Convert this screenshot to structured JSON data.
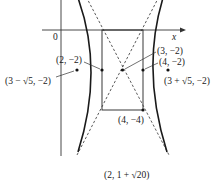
{
  "figure": {
    "type": "hyperbola",
    "center": "(3, −2)",
    "axes": {
      "x_label": "x",
      "origin_label": "0"
    },
    "points": [
      {
        "id": "vertex-left",
        "label": "(2, −2)"
      },
      {
        "id": "center",
        "label": "(3, −2)"
      },
      {
        "id": "vertex-right",
        "label": "(4, −2)"
      },
      {
        "id": "focus-left",
        "label": "(3 − √5, −2)"
      },
      {
        "id": "focus-right",
        "label": "(3 + √5, −2)"
      },
      {
        "id": "box-corner",
        "label": "(4, −4)"
      }
    ],
    "caption": "(2, 1 + √20)",
    "colors": {
      "curve": "#1a1a1a",
      "asymptote": "#333333",
      "axis": "#333333"
    }
  }
}
